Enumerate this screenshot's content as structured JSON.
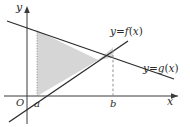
{
  "figure": {
    "type": "coordinate-plane-diagram",
    "width": 190,
    "height": 127,
    "axes": {
      "x_label": "x",
      "y_label": "y",
      "origin_label": "O",
      "x_axis_y": 96,
      "y_axis_x": 27
    },
    "ticks": [
      {
        "name": "a",
        "label": "a",
        "x": 37
      },
      {
        "name": "b",
        "label": "b",
        "x": 113
      }
    ],
    "curves": [
      {
        "name": "f",
        "label_html": "<i>y</i>=<i>f</i>(<i>x</i>)",
        "label_x": 113,
        "label_y": 31,
        "kind": "line-increasing",
        "x1": 9,
        "y1": 122,
        "x2": 128,
        "y2": 41
      },
      {
        "name": "g",
        "label_html": "<i>y</i>=<i>g</i>(<i>x</i>)",
        "label_x": 146,
        "label_y": 68,
        "kind": "line-decreasing",
        "x1": 7,
        "y1": 21,
        "x2": 174,
        "y2": 79
      }
    ],
    "intersection": {
      "x": 98,
      "y": 60
    },
    "guides": [
      {
        "name": "guide-a",
        "style": "dotted",
        "x": 37,
        "y_top": 31,
        "y_bottom": 96
      },
      {
        "name": "guide-b",
        "style": "dashed",
        "x": 113,
        "y_top": 48,
        "y_bottom": 96
      }
    ],
    "shaded_region": {
      "name": "area-between-curves",
      "fill": "#d4d4d4",
      "opacity": 0.85,
      "points": "37,96 37,31 113,57 113,48"
    },
    "colors": {
      "line": "#2b2b2b",
      "axis": "#4a4a4a",
      "shade": "#d4d4d4",
      "guide": "#9a9a9a",
      "background": "#ffffff"
    }
  }
}
